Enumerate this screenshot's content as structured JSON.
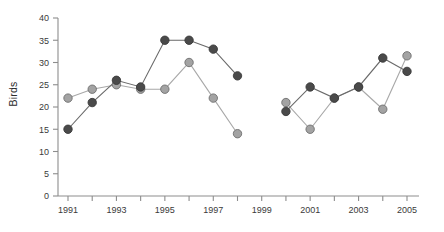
{
  "chart_data": {
    "type": "line",
    "title": "",
    "xlabel": "",
    "ylabel": "Birds",
    "ylim": [
      0,
      40
    ],
    "xlim": [
      1990.5,
      2005.5
    ],
    "grid": false,
    "legend": "none",
    "y_ticks": [
      0,
      5,
      10,
      15,
      20,
      25,
      30,
      35,
      40
    ],
    "x_ticks": [
      1991,
      1993,
      1995,
      1997,
      1999,
      2001,
      2003,
      2005
    ],
    "x_minor_ticks": [
      1992,
      1994,
      1996,
      1998,
      2000,
      2002,
      2004
    ],
    "x_tick_labels": [
      "1991",
      "1993",
      "1995",
      "1997",
      "1999",
      "2001",
      "2003",
      "2005"
    ],
    "y_tick_labels": [
      "0",
      "5",
      "10",
      "15",
      "20",
      "25",
      "30",
      "35",
      "40"
    ],
    "series": [
      {
        "name": "light-gray-series",
        "color": "#a3a3a3",
        "marker": "filled-circle-light",
        "x": [
          1991,
          1992,
          1993,
          1994,
          1995,
          1996,
          1997,
          1998,
          2000,
          2001,
          2002,
          2003,
          2004,
          2005
        ],
        "values": [
          22,
          24,
          25,
          24,
          24,
          30,
          22,
          14,
          21,
          15,
          22,
          24.5,
          19.5,
          31.5
        ]
      },
      {
        "name": "dark-gray-series",
        "color": "#4a4a4a",
        "marker": "filled-circle-dark",
        "x": [
          1991,
          1992,
          1993,
          1994,
          1995,
          1996,
          1997,
          1998,
          2000,
          2001,
          2002,
          2003,
          2004,
          2005
        ],
        "values": [
          15,
          21,
          26,
          24.5,
          35,
          35,
          33,
          27,
          19,
          24.5,
          22,
          24.5,
          31,
          28
        ]
      }
    ]
  }
}
